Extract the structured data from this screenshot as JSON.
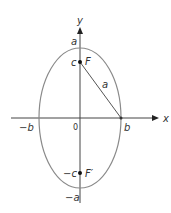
{
  "diagram": {
    "type": "ellipse with vertical major axis",
    "center": [
      80,
      118
    ],
    "semi_major_vertical": 70,
    "semi_minor_horizontal": 41,
    "colors": {
      "ellipse": "#8a8a8a",
      "axes": "#444444",
      "foci": "#111111"
    },
    "labels": {
      "y_axis": "y",
      "x_axis": "x",
      "top_vertex": "a",
      "bottom_vertex": "−a",
      "right_vertex": "b",
      "left_vertex": "−b",
      "origin": "0",
      "focus_top_coord": "c",
      "focus_top": "F",
      "focus_bottom_coord": "−c",
      "focus_bottom": "F′",
      "segment": "a"
    }
  }
}
